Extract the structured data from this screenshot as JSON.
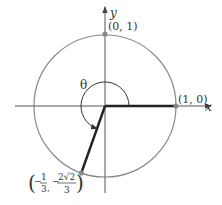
{
  "figure": {
    "type": "unit-circle-angle-diagram",
    "axes": {
      "x_label": "x",
      "y_label": "y"
    },
    "points": [
      {
        "id": "p_x_intercept",
        "label": "(1, 0)",
        "coords": [
          1,
          0
        ]
      },
      {
        "id": "p_y_intercept",
        "label": "(0, 1)",
        "coords": [
          0,
          1
        ]
      },
      {
        "id": "p_terminal",
        "label_parts": {
          "x_sign": "−",
          "x_num": "1",
          "x_den": "3",
          "y_sign": "−",
          "y_num": "2√2",
          "y_den": "3"
        },
        "coords": [
          -0.3333,
          -0.9428
        ]
      }
    ],
    "angle": {
      "label": "θ",
      "direction": "counterclockwise",
      "from": "positive x-axis",
      "to": "terminal point"
    },
    "colors": {
      "circle": "#8a8a8a",
      "axes": "#555555",
      "radius_lines": "#222222",
      "points": "#888888",
      "text": "#333333"
    }
  }
}
